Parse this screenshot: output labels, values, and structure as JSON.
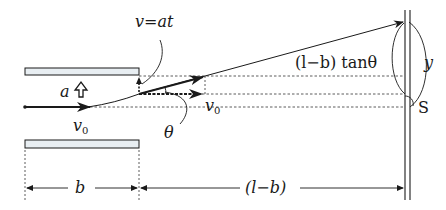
{
  "diagram": {
    "labels": {
      "velocity_vertical": "v=at",
      "acceleration": "a",
      "v0_entry": "v",
      "v0_entry_sub": "0",
      "v0_mid": "v",
      "v0_mid_sub": "0",
      "theta": "θ",
      "screen_offset_expr": "(l−b) tanθ",
      "deflection": "y",
      "origin_point": "S",
      "plate_length": "b",
      "drift_length": "(l−b)"
    },
    "colors": {
      "line": "#1a1a1a",
      "plate_fill": "#e8eef2",
      "dashed": "#333333"
    },
    "geometry": {
      "plate_left_x": 25,
      "plate_right_x": 139,
      "top_plate_y": 68,
      "bottom_plate_y": 140,
      "axis_y": 107,
      "screen_x": 405
    }
  }
}
